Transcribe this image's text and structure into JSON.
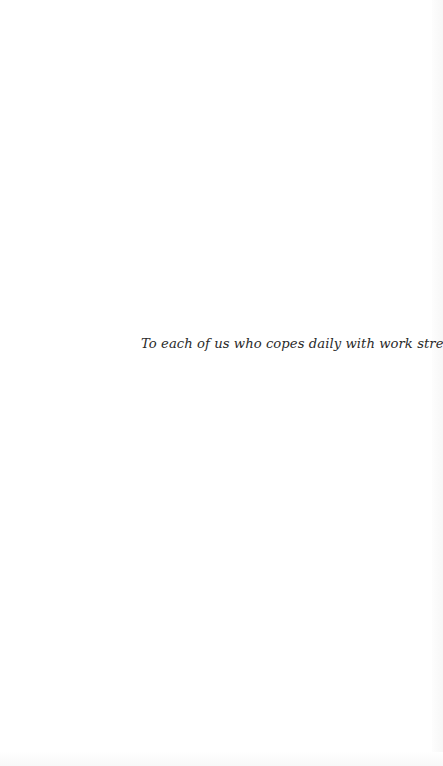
{
  "page": {
    "type": "dedication",
    "dedication_text": "To each of us who copes daily with work stress"
  },
  "colors": {
    "background": "#ffffff",
    "text": "#2a2a2a"
  }
}
